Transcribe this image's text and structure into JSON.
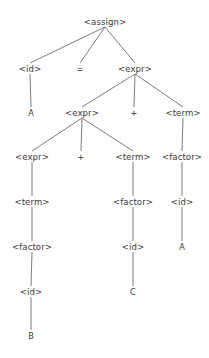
{
  "diagram": {
    "type": "parse-tree",
    "background_color": "#ffffff",
    "edge_color": "#6e6e6e",
    "text_color": "#3a3a3a",
    "width": 209,
    "height": 358,
    "nodes": [
      {
        "id": "n0",
        "label": "<assign>",
        "kind": "nonterminal",
        "x": 105,
        "y": 22,
        "row": 1
      },
      {
        "id": "n1",
        "label": "<id>",
        "kind": "nonterminal",
        "x": 30,
        "y": 69,
        "row": 2
      },
      {
        "id": "n2",
        "label": "=",
        "kind": "operator",
        "x": 80,
        "y": 69,
        "row": 2
      },
      {
        "id": "n3",
        "label": "<expr>",
        "kind": "nonterminal",
        "x": 135,
        "y": 69,
        "row": 2
      },
      {
        "id": "n4",
        "label": "A",
        "kind": "terminal",
        "x": 31,
        "y": 113,
        "row": 3
      },
      {
        "id": "n5",
        "label": "<expr>",
        "kind": "nonterminal",
        "x": 82,
        "y": 113,
        "row": 3
      },
      {
        "id": "n6",
        "label": "+",
        "kind": "operator",
        "x": 134,
        "y": 113,
        "row": 3
      },
      {
        "id": "n7",
        "label": "<term>",
        "kind": "nonterminal",
        "x": 183,
        "y": 113,
        "row": 3
      },
      {
        "id": "n8",
        "label": "<expr>",
        "kind": "nonterminal",
        "x": 32,
        "y": 157,
        "row": 4
      },
      {
        "id": "n9",
        "label": "+",
        "kind": "operator",
        "x": 81,
        "y": 157,
        "row": 4
      },
      {
        "id": "n10",
        "label": "<term>",
        "kind": "nonterminal",
        "x": 133,
        "y": 157,
        "row": 4
      },
      {
        "id": "n11",
        "label": "<factor>",
        "kind": "nonterminal",
        "x": 182,
        "y": 157,
        "row": 4
      },
      {
        "id": "n12",
        "label": "<term>",
        "kind": "nonterminal",
        "x": 32,
        "y": 202,
        "row": 5
      },
      {
        "id": "n13",
        "label": "<factor>",
        "kind": "nonterminal",
        "x": 133,
        "y": 202,
        "row": 5
      },
      {
        "id": "n14",
        "label": "<id>",
        "kind": "nonterminal",
        "x": 182,
        "y": 202,
        "row": 5
      },
      {
        "id": "n15",
        "label": "<factor>",
        "kind": "nonterminal",
        "x": 32,
        "y": 247,
        "row": 6
      },
      {
        "id": "n16",
        "label": "<id>",
        "kind": "nonterminal",
        "x": 133,
        "y": 247,
        "row": 6
      },
      {
        "id": "n17",
        "label": "A",
        "kind": "terminal",
        "x": 182,
        "y": 247,
        "row": 6
      },
      {
        "id": "n18",
        "label": "<id>",
        "kind": "nonterminal",
        "x": 31,
        "y": 292,
        "row": 7
      },
      {
        "id": "n19",
        "label": "C",
        "kind": "terminal",
        "x": 133,
        "y": 292,
        "row": 7
      },
      {
        "id": "n20",
        "label": "B",
        "kind": "terminal",
        "x": 31,
        "y": 336,
        "row": 8
      }
    ],
    "edges": [
      {
        "from": "n0",
        "to": "n1"
      },
      {
        "from": "n0",
        "to": "n2"
      },
      {
        "from": "n0",
        "to": "n3"
      },
      {
        "from": "n1",
        "to": "n4"
      },
      {
        "from": "n3",
        "to": "n5"
      },
      {
        "from": "n3",
        "to": "n6"
      },
      {
        "from": "n3",
        "to": "n7"
      },
      {
        "from": "n5",
        "to": "n8"
      },
      {
        "from": "n5",
        "to": "n9"
      },
      {
        "from": "n5",
        "to": "n10"
      },
      {
        "from": "n7",
        "to": "n11"
      },
      {
        "from": "n8",
        "to": "n12"
      },
      {
        "from": "n10",
        "to": "n13"
      },
      {
        "from": "n11",
        "to": "n14"
      },
      {
        "from": "n12",
        "to": "n15"
      },
      {
        "from": "n13",
        "to": "n16"
      },
      {
        "from": "n14",
        "to": "n17"
      },
      {
        "from": "n15",
        "to": "n18"
      },
      {
        "from": "n16",
        "to": "n19"
      },
      {
        "from": "n18",
        "to": "n20"
      }
    ]
  }
}
